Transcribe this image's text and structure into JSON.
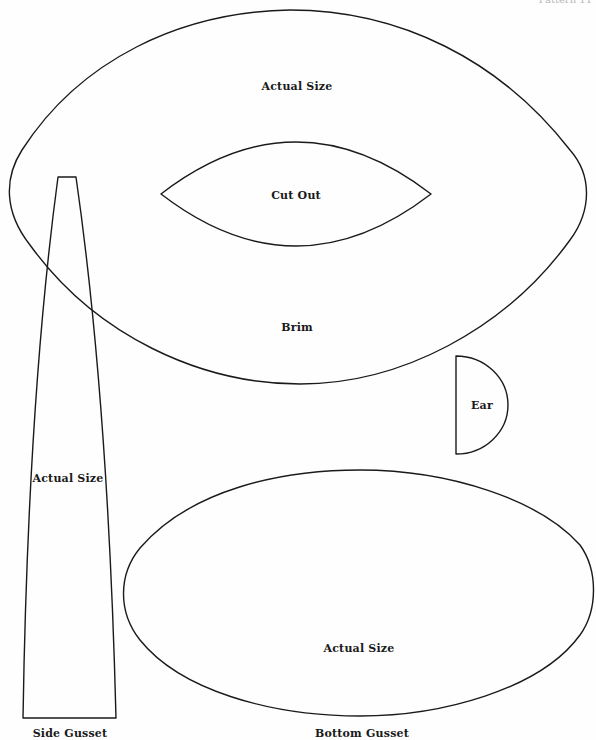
{
  "page": {
    "header_fragment": "Pattern 11"
  },
  "pieces": {
    "brim": {
      "name": "Brim",
      "note": "Actual Size",
      "cutout_label": "Cut Out"
    },
    "side_gusset": {
      "name": "Side Gusset",
      "note": "Actual Size"
    },
    "ear": {
      "name": "Ear"
    },
    "bottom_gusset": {
      "name": "Bottom Gusset",
      "note": "Actual Size"
    }
  },
  "colors": {
    "outline": "#1a1a1a",
    "background": "#ffffff"
  }
}
